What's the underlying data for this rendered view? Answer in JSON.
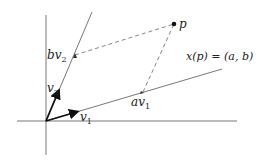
{
  "figure": {
    "type": "coordinate-basis-diagram",
    "labels": {
      "v1": {
        "base": "v",
        "sub": "1"
      },
      "v2": {
        "base": "v",
        "sub": "2"
      },
      "av1": {
        "base": "av",
        "sub": "1"
      },
      "bv2": {
        "base": "bv",
        "sub": "2"
      },
      "p": "p",
      "equation": "x(p) = (a, b)"
    },
    "colors": {
      "axis": "#555555",
      "basis_line": "#555555",
      "vector": "#111111",
      "dashed": "#666666",
      "point": "#111111"
    }
  }
}
